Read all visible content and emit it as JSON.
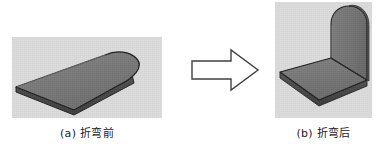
{
  "figure": {
    "type": "technical-illustration",
    "background_color": "#ffffff",
    "panel_background": "#dcdcdc",
    "metal_face_color": "#7b7b7b",
    "metal_top_face_color": "#757575",
    "metal_edge_color": "#4a4a4a",
    "outline_color": "#1e1e1e"
  },
  "panels": [
    {
      "id": "a",
      "caption": "(a) 折弯前",
      "caption_label": "(a)",
      "caption_text": "折弯前",
      "description": "flat sheet metal blank with one rounded end, isometric view"
    },
    {
      "id": "b",
      "caption": "(b) 折弯后",
      "caption_label": "(b)",
      "caption_text": "折弯后",
      "description": "sheet metal part bent 90 degrees, rounded end forms upright flange"
    }
  ],
  "arrow": {
    "name": "block-arrow-right",
    "direction": "right",
    "fill": "#ffffff",
    "stroke": "#404040"
  }
}
